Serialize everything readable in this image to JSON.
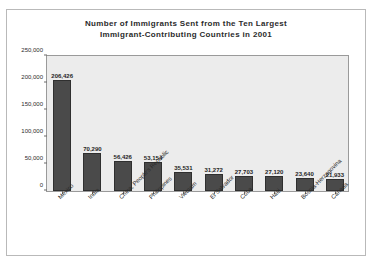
{
  "chart_data": {
    "type": "bar",
    "title": "Number of Immigrants Sent from the Ten Largest Immigrant-Contributing Countries in 2001",
    "title_lines": [
      "Number of Immigrants Sent from the Ten Largest",
      "Immigrant-Contributing Countries in 2001"
    ],
    "xlabel": "",
    "ylabel": "",
    "ylim": [
      0,
      250000
    ],
    "ytick_labels": [
      "0",
      "50,000",
      "100,000",
      "150,000",
      "200,000",
      "250,000"
    ],
    "ytick_values": [
      0,
      50000,
      100000,
      150000,
      200000,
      250000
    ],
    "grid": false,
    "legend": "none",
    "categories": [
      "Mexico",
      "India",
      "China, People's Republic",
      "Philippines",
      "Vietnam",
      "El Salvador",
      "Cuba",
      "Haiti",
      "Bosnia-Herzegovina",
      "Canada"
    ],
    "values": [
      206426,
      70290,
      56426,
      53154,
      35531,
      31272,
      27703,
      27120,
      23640,
      21933
    ],
    "value_labels": [
      "206,426",
      "70,290",
      "56,426",
      "53,154",
      "35,531",
      "31,272",
      "27,703",
      "27,120",
      "23,640",
      "21,933"
    ],
    "bar_color": "#4a4a4a",
    "plot_background": "#ececec",
    "frame_color": "#9a9a9a"
  }
}
